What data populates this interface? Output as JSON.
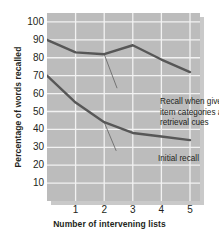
{
  "chart_data": {
    "type": "line",
    "title": "",
    "xlabel": "Number of intervening lists",
    "ylabel": "Percentage of words recalled",
    "x": [
      0,
      1,
      2,
      3,
      4,
      5
    ],
    "xlim": [
      0,
      5.35
    ],
    "ylim": [
      0,
      105
    ],
    "xticks": [
      "1",
      "2",
      "3",
      "4",
      "5"
    ],
    "xtick_values": [
      1,
      2,
      3,
      4,
      5
    ],
    "yticks": [
      "10",
      "20",
      "30",
      "40",
      "50",
      "60",
      "70",
      "80",
      "90",
      "100"
    ],
    "ytick_values": [
      10,
      20,
      30,
      40,
      50,
      60,
      70,
      80,
      90,
      100
    ],
    "grid": true,
    "legend": "none",
    "plot_background": "#bcbcbc",
    "gridline_color": "#f2f2f2",
    "line_color": "#575757",
    "leader_color": "#6b6b6b",
    "series": [
      {
        "name": "Recall when given item categories as retrieval cues",
        "values": [
          90,
          83,
          82,
          87,
          79,
          72
        ]
      },
      {
        "name": "Initial recall",
        "values": [
          70,
          55,
          44,
          38,
          36,
          34
        ]
      }
    ],
    "annotations": [
      {
        "id": "cued",
        "lines": [
          "Recall when given",
          "item categories as",
          "retrieval cues"
        ],
        "anchor_x": 2.0,
        "anchor_y": 82
      },
      {
        "id": "initial",
        "lines": [
          "Initial recall"
        ],
        "anchor_x": 2.0,
        "anchor_y": 44
      }
    ]
  }
}
